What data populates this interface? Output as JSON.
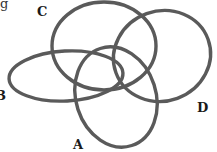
{
  "figure": {
    "type": "interlocking-rings",
    "stroke_color": "#5a5a5a",
    "background": "#ffffff",
    "rings": [
      {
        "id": "C",
        "cx": 104,
        "cy": 46,
        "rx": 52,
        "ry": 44,
        "rotate": 0
      },
      {
        "id": "B",
        "cx": 66,
        "cy": 76,
        "rx": 57,
        "ry": 25,
        "rotate": -3
      },
      {
        "id": "A",
        "cx": 116,
        "cy": 97,
        "rx": 40,
        "ry": 51,
        "rotate": -18
      },
      {
        "id": "D",
        "cx": 162,
        "cy": 56,
        "rx": 49,
        "ry": 45,
        "rotate": -20
      }
    ],
    "labels": {
      "top_fragment": "g",
      "c": "C",
      "b": "B",
      "a": "A",
      "d": "D"
    }
  }
}
